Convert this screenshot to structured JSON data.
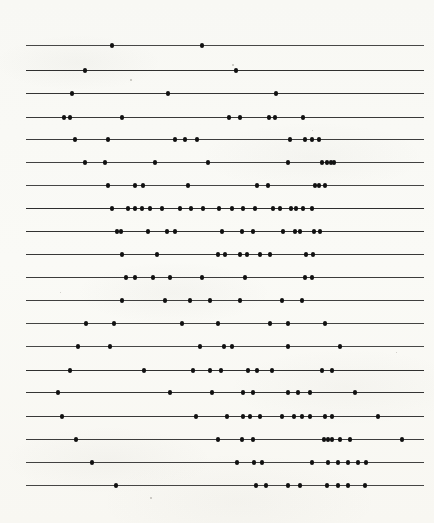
{
  "figure": {
    "kind": "raster-plot",
    "row_count": 20,
    "line_color": "#1c1c1c",
    "dot_color": "#111111",
    "background_color": "#fdfdfb"
  },
  "chart_data": {
    "type": "scatter",
    "title": "",
    "subtitle": "",
    "xlabel": "",
    "ylabel": "",
    "xlim": [
      26,
      424
    ],
    "ylim": [
      0,
      20
    ],
    "grid": false,
    "legend": null,
    "annotations": [],
    "axis_ticks": {
      "x": [],
      "y": []
    },
    "line_extent": {
      "x_start": 26,
      "x_end": 424
    },
    "row_y_positions": [
      45,
      70,
      93,
      117,
      139,
      162,
      185,
      208,
      231,
      254,
      277,
      300,
      323,
      346,
      370,
      392,
      416,
      439,
      462,
      485
    ],
    "series": [
      {
        "name": "row-1",
        "y": 45,
        "x_start": 26,
        "x_end": 424,
        "values": [
          112,
          202
        ]
      },
      {
        "name": "row-2",
        "y": 70,
        "x_start": 26,
        "x_end": 424,
        "values": [
          85,
          236
        ]
      },
      {
        "name": "row-3",
        "y": 93,
        "x_start": 26,
        "x_end": 424,
        "values": [
          72,
          168,
          276
        ]
      },
      {
        "name": "row-4",
        "y": 117,
        "x_start": 26,
        "x_end": 424,
        "values": [
          64,
          70,
          122,
          229,
          240,
          269,
          275,
          303
        ]
      },
      {
        "name": "row-5",
        "y": 139,
        "x_start": 26,
        "x_end": 424,
        "values": [
          75,
          108,
          175,
          185,
          197,
          290,
          305,
          312,
          319
        ]
      },
      {
        "name": "row-6",
        "y": 162,
        "x_start": 26,
        "x_end": 424,
        "values": [
          85,
          105,
          155,
          208,
          288,
          322,
          327,
          331,
          334
        ]
      },
      {
        "name": "row-7",
        "y": 185,
        "x_start": 26,
        "x_end": 424,
        "values": [
          108,
          135,
          143,
          188,
          257,
          268,
          315,
          319,
          325
        ]
      },
      {
        "name": "row-8",
        "y": 208,
        "x_start": 26,
        "x_end": 424,
        "values": [
          112,
          128,
          135,
          142,
          150,
          162,
          180,
          191,
          203,
          219,
          232,
          243,
          255,
          273,
          280,
          291,
          296,
          303,
          312
        ]
      },
      {
        "name": "row-9",
        "y": 231,
        "x_start": 26,
        "x_end": 424,
        "values": [
          117,
          121,
          148,
          167,
          175,
          222,
          242,
          253,
          283,
          295,
          300,
          314,
          320
        ]
      },
      {
        "name": "row-10",
        "y": 254,
        "x_start": 26,
        "x_end": 424,
        "values": [
          122,
          157,
          218,
          225,
          240,
          247,
          260,
          270,
          306,
          313
        ]
      },
      {
        "name": "row-11",
        "y": 277,
        "x_start": 26,
        "x_end": 424,
        "values": [
          126,
          135,
          153,
          170,
          202,
          245,
          305,
          312
        ]
      },
      {
        "name": "row-12",
        "y": 300,
        "x_start": 26,
        "x_end": 424,
        "values": [
          122,
          165,
          190,
          210,
          240,
          282,
          302
        ]
      },
      {
        "name": "row-13",
        "y": 323,
        "x_start": 26,
        "x_end": 424,
        "values": [
          86,
          114,
          182,
          218,
          270,
          288,
          325
        ]
      },
      {
        "name": "row-14",
        "y": 346,
        "x_start": 26,
        "x_end": 424,
        "values": [
          78,
          110,
          200,
          224,
          232,
          288,
          340
        ]
      },
      {
        "name": "row-15",
        "y": 370,
        "x_start": 26,
        "x_end": 424,
        "values": [
          70,
          144,
          193,
          210,
          221,
          248,
          257,
          272,
          322,
          332
        ]
      },
      {
        "name": "row-16",
        "y": 392,
        "x_start": 26,
        "x_end": 424,
        "values": [
          58,
          170,
          212,
          243,
          253,
          288,
          298,
          310,
          355
        ]
      },
      {
        "name": "row-17",
        "y": 416,
        "x_start": 26,
        "x_end": 424,
        "values": [
          62,
          196,
          227,
          243,
          250,
          260,
          282,
          294,
          302,
          310,
          325,
          332,
          378
        ]
      },
      {
        "name": "row-18",
        "y": 439,
        "x_start": 26,
        "x_end": 424,
        "values": [
          76,
          218,
          242,
          253,
          324,
          328,
          332,
          340,
          350,
          402
        ]
      },
      {
        "name": "row-19",
        "y": 462,
        "x_start": 26,
        "x_end": 424,
        "values": [
          92,
          237,
          254,
          262,
          312,
          328,
          338,
          348,
          358,
          366
        ]
      },
      {
        "name": "row-20",
        "y": 485,
        "x_start": 26,
        "x_end": 424,
        "values": [
          116,
          256,
          266,
          288,
          300,
          327,
          338,
          348,
          365
        ]
      }
    ]
  },
  "specks": [
    {
      "x": 232,
      "y": 64,
      "size": 1.6
    },
    {
      "x": 130,
      "y": 79,
      "size": 1.6
    },
    {
      "x": 312,
      "y": 130,
      "size": 1.4
    },
    {
      "x": 60,
      "y": 292,
      "size": 1.4
    },
    {
      "x": 396,
      "y": 352,
      "size": 1.4
    },
    {
      "x": 150,
      "y": 497,
      "size": 1.5
    }
  ]
}
